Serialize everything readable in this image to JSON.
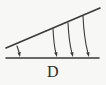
{
  "figure": {
    "label": "D",
    "caption_label": "D",
    "stroke_color": "#3a3a3a",
    "background_color": "#f7f7f5",
    "label_color": "#2b2b2b"
  },
  "chart_data": {
    "type": "diagram",
    "title": "D",
    "xlabel": "",
    "ylabel": "",
    "xlim": [
      0,
      106
    ],
    "ylim": [
      0,
      85
    ],
    "grid": false,
    "legend": false,
    "elements": [
      {
        "name": "baseline",
        "kind": "line",
        "x1": 6,
        "y1": 58,
        "x2": 99,
        "y2": 58,
        "stroke_width": 1.6
      },
      {
        "name": "inclined-line",
        "kind": "line",
        "x1": 6,
        "y1": 48,
        "x2": 100,
        "y2": 8,
        "stroke_width": 1.6
      },
      {
        "name": "arrow-1",
        "kind": "curved-arrow",
        "start": [
          17,
          46
        ],
        "control": [
          19,
          52
        ],
        "end": [
          20,
          57
        ],
        "arrowhead": "down",
        "stroke_width": 1.1
      },
      {
        "name": "arrow-2",
        "kind": "curved-arrow",
        "start": [
          53,
          29
        ],
        "control": [
          54,
          46
        ],
        "end": [
          57,
          57
        ],
        "arrowhead": "down",
        "stroke_width": 1.1
      },
      {
        "name": "arrow-3",
        "kind": "curved-arrow",
        "start": [
          68,
          23
        ],
        "control": [
          69,
          42
        ],
        "end": [
          73,
          57
        ],
        "arrowhead": "down",
        "stroke_width": 1.1
      },
      {
        "name": "arrow-4",
        "kind": "curved-arrow",
        "start": [
          83,
          16
        ],
        "control": [
          84,
          38
        ],
        "end": [
          89,
          57
        ],
        "arrowhead": "down",
        "stroke_width": 1.1
      }
    ],
    "annotations": [
      {
        "name": "figure-letter",
        "text": "D",
        "x": 53,
        "y": 73
      }
    ]
  }
}
